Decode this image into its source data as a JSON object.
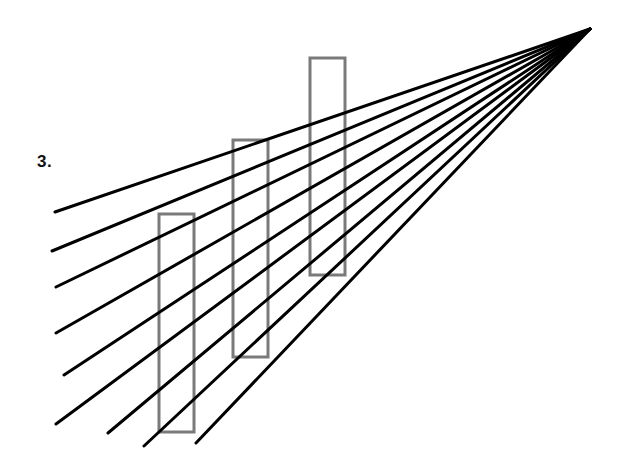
{
  "figure": {
    "label": "3.",
    "apex": [
      590,
      29
    ],
    "line_color": "#000000",
    "line_width": 3,
    "lines": [
      {
        "x": 55,
        "y": 212
      },
      {
        "x": 52,
        "y": 251
      },
      {
        "x": 56,
        "y": 287
      },
      {
        "x": 56,
        "y": 333
      },
      {
        "x": 64,
        "y": 375
      },
      {
        "x": 56,
        "y": 424
      },
      {
        "x": 108,
        "y": 433
      },
      {
        "x": 144,
        "y": 446
      },
      {
        "x": 196,
        "y": 443
      }
    ],
    "rect_color": "#7a7a7a",
    "rect_stroke": 3,
    "rectangles": [
      {
        "x": 159,
        "y": 214,
        "w": 35,
        "h": 218
      },
      {
        "x": 233,
        "y": 140,
        "w": 35,
        "h": 217
      },
      {
        "x": 310,
        "y": 58,
        "w": 35,
        "h": 217
      }
    ]
  }
}
